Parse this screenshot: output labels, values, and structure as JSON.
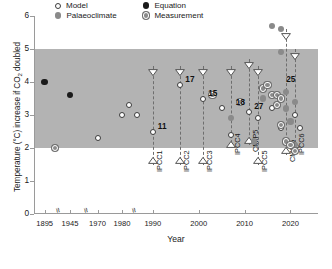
{
  "legend": {
    "items": [
      {
        "label": "Model",
        "marker": "model-open-circle"
      },
      {
        "label": "Equation",
        "marker": "equation-filled-black-circle"
      },
      {
        "label": "Palaeoclimate",
        "marker": "palaeoclimate-grey-circle"
      },
      {
        "label": "Measurement",
        "marker": "measurement-ringed-grey-circle"
      }
    ]
  },
  "chart_data": {
    "type": "scatter",
    "title": "",
    "xlabel": "Year",
    "ylabel": "Temperature (°C) increase if CO2 doubled",
    "xlim": [
      1890,
      2026
    ],
    "ylim": [
      0,
      6
    ],
    "grid": false,
    "legend_position": "top-center",
    "axis_breaks": [
      1920,
      1957,
      1985
    ],
    "xticks": [
      1895,
      1945,
      1970,
      1980,
      1990,
      2000,
      2010,
      2020
    ],
    "yticks": [
      0,
      1,
      2,
      3,
      4,
      5,
      6
    ],
    "shaded_band": {
      "label": "likely range",
      "ymin": 2,
      "ymax": 5,
      "color": "#b3b3b3"
    },
    "series": [
      {
        "name": "Equation",
        "marker": "equation",
        "points": [
          {
            "x": 1895,
            "y": 4.0
          },
          {
            "x": 1945,
            "y": 3.6
          }
        ]
      },
      {
        "name": "Model",
        "marker": "model",
        "points": [
          {
            "x": 1970,
            "y": 2.3
          },
          {
            "x": 1980,
            "y": 3.0
          },
          {
            "x": 1983,
            "y": 3.3
          },
          {
            "x": 1986,
            "y": 3.0
          },
          {
            "x": 1990,
            "y": 2.5
          },
          {
            "x": 1996,
            "y": 3.9
          },
          {
            "x": 2001,
            "y": 3.5
          },
          {
            "x": 2005,
            "y": 3.2
          },
          {
            "x": 2007,
            "y": 2.4
          },
          {
            "x": 2011,
            "y": 3.1
          },
          {
            "x": 2013,
            "y": 2.9
          },
          {
            "x": 2016,
            "y": 3.2
          },
          {
            "x": 2018,
            "y": 2.6
          },
          {
            "x": 2021,
            "y": 3.0
          },
          {
            "x": 2022,
            "y": 2.6
          }
        ]
      },
      {
        "name": "Palaeoclimate",
        "marker": "palaeoclimate",
        "points": [
          {
            "x": 2007,
            "y": 2.9
          },
          {
            "x": 2012,
            "y": 2.2
          },
          {
            "x": 2014,
            "y": 3.5
          },
          {
            "x": 2016,
            "y": 5.7
          },
          {
            "x": 2018,
            "y": 5.6
          },
          {
            "x": 2018,
            "y": 4.9
          },
          {
            "x": 2019,
            "y": 3.7
          },
          {
            "x": 2019,
            "y": 3.2
          },
          {
            "x": 2020,
            "y": 2.8
          },
          {
            "x": 2021,
            "y": 3.4
          },
          {
            "x": 2021,
            "y": 2.1
          }
        ]
      },
      {
        "name": "Measurement",
        "marker": "measurement",
        "points": [
          {
            "x": 1900,
            "y": 2.0
          },
          {
            "x": 2003,
            "y": 3.6
          },
          {
            "x": 2009,
            "y": 3.4
          },
          {
            "x": 2014,
            "y": 3.8
          },
          {
            "x": 2015,
            "y": 3.9
          },
          {
            "x": 2016,
            "y": 3.6
          },
          {
            "x": 2017,
            "y": 3.6
          },
          {
            "x": 2017,
            "y": 3.3
          },
          {
            "x": 2018,
            "y": 3.5
          },
          {
            "x": 2018,
            "y": 2.7
          },
          {
            "x": 2019,
            "y": 2.2
          },
          {
            "x": 2020,
            "y": 2.1
          },
          {
            "x": 2021,
            "y": 1.9
          }
        ]
      }
    ],
    "assessment_ranges": [
      {
        "label": "IPCC1",
        "year": 1990,
        "low": 1.5,
        "high": 4.5
      },
      {
        "label": "IPCC2",
        "year": 1996,
        "low": 1.5,
        "high": 4.5
      },
      {
        "label": "IPCC3",
        "year": 2001,
        "low": 1.5,
        "high": 4.5
      },
      {
        "label": "IPCC4",
        "year": 2007,
        "low": 2.0,
        "high": 4.5
      },
      {
        "label": "CMIP5",
        "year": 2011,
        "low": 2.1,
        "high": 4.7
      },
      {
        "label": "IPCC5",
        "year": 2013,
        "low": 1.5,
        "high": 4.5
      },
      {
        "label": "CMIP6",
        "year": 2019,
        "low": 1.8,
        "high": 5.6
      },
      {
        "label": "IPCC6",
        "year": 2021,
        "low": 2.0,
        "high": 5.0
      }
    ],
    "annotations": [
      {
        "text": "11",
        "x": 1990,
        "y": 2.5
      },
      {
        "text": "17",
        "x": 1996,
        "y": 3.9
      },
      {
        "text": "15",
        "x": 2001,
        "y": 3.5
      },
      {
        "text": "18",
        "x": 2007,
        "y": 3.2
      },
      {
        "text": "27",
        "x": 2011,
        "y": 3.1
      },
      {
        "text": "25",
        "x": 2018,
        "y": 3.9
      }
    ]
  }
}
